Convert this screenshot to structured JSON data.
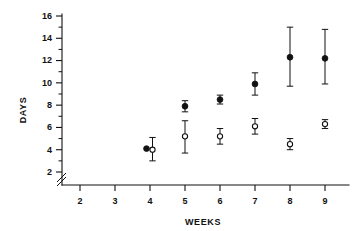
{
  "chart_data": {
    "type": "scatter",
    "title": "",
    "xlabel": "WEEKS",
    "ylabel": "DAYS",
    "xlim": [
      1.5,
      9.6
    ],
    "ylim": [
      2,
      16
    ],
    "xticks": [
      2,
      3,
      4,
      5,
      6,
      7,
      8,
      9
    ],
    "yticks": [
      2,
      4,
      6,
      8,
      10,
      12,
      14,
      16
    ],
    "y_minor_ticks": [
      3,
      5,
      7,
      9,
      11,
      13,
      15
    ],
    "grid": false,
    "legend": "none",
    "axis_break": {
      "axis": "y",
      "at": 2.4,
      "style": "double-slash"
    },
    "error_bars": "vertical",
    "series": [
      {
        "name": "filled-circle-series",
        "marker": "filled-circle",
        "x": [
          4,
          5,
          6,
          7,
          8,
          9
        ],
        "values": [
          4.1,
          7.9,
          8.5,
          9.9,
          12.3,
          12.2
        ],
        "err_low": [
          4.1,
          7.4,
          8.1,
          8.9,
          9.7,
          9.9
        ],
        "err_high": [
          4.1,
          8.4,
          8.9,
          10.9,
          15.0,
          14.8
        ]
      },
      {
        "name": "open-circle-series",
        "marker": "open-circle",
        "x": [
          4,
          5,
          6,
          7,
          8,
          9
        ],
        "values": [
          4.0,
          5.2,
          5.2,
          6.1,
          4.5,
          6.3
        ],
        "err_low": [
          3.0,
          3.7,
          4.5,
          5.4,
          4.0,
          5.9
        ],
        "err_high": [
          5.1,
          6.6,
          5.9,
          6.8,
          5.0,
          6.7
        ]
      }
    ]
  },
  "labels": {
    "x_axis_title": "WEEKS",
    "y_axis_title": "DAYS",
    "xticks": [
      "2",
      "3",
      "4",
      "5",
      "6",
      "7",
      "8",
      "9"
    ],
    "yticks": [
      "2",
      "4",
      "6",
      "8",
      "10",
      "12",
      "14",
      "16"
    ]
  },
  "colors": {
    "ink": "#111111",
    "background": "#ffffff"
  }
}
